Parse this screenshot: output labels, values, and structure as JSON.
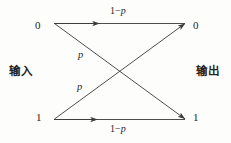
{
  "figure": {
    "background_color": "#fdfdfc",
    "line_color": "#3a3a3a"
  },
  "nodes": {
    "input_top": "0",
    "input_bottom": "1",
    "output_top": "0",
    "output_bottom": "1"
  },
  "side_labels": {
    "input": "输入",
    "output": "输出"
  },
  "edges": [
    {
      "id": "top-straight",
      "from": "input_top",
      "to": "output_top",
      "label_prefix": "1−",
      "label_symbol": "p",
      "label": "1−p"
    },
    {
      "id": "upper-cross",
      "from": "input_top",
      "to": "output_bottom",
      "label_prefix": "",
      "label_symbol": "p",
      "label": "p"
    },
    {
      "id": "lower-cross",
      "from": "input_bottom",
      "to": "output_top",
      "label_prefix": "",
      "label_symbol": "p",
      "label": "p"
    },
    {
      "id": "bottom-straight",
      "from": "input_bottom",
      "to": "output_bottom",
      "label_prefix": "1−",
      "label_symbol": "p",
      "label": "1−p"
    }
  ],
  "geometry": {
    "input_top_point": "54,23",
    "input_bottom_point": "54,119",
    "output_top_point": "186,23",
    "output_bottom_point": "186,119",
    "crossing_point": "120,71"
  }
}
